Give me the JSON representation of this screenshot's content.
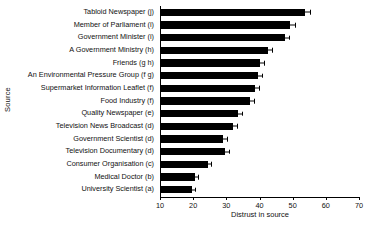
{
  "chart_data": {
    "type": "bar",
    "orientation": "horizontal",
    "title": "",
    "xlabel": "Distrust in source",
    "ylabel": "Source",
    "xlim": [
      10,
      70
    ],
    "xticks": [
      10,
      20,
      30,
      40,
      50,
      60,
      70
    ],
    "xticklabels": [
      "10",
      "20",
      "30",
      "40",
      "50",
      "60",
      "70"
    ],
    "grid": false,
    "legend": null,
    "categories": [
      "Tabloid Newspaper (j)",
      "Member of Parliament (i)",
      "Government Minister (i)",
      "A Government Ministry (h)",
      "Friends (g h)",
      "An Environmental Pressure Group (f g)",
      "Supermarket Information Leaflet (f)",
      "Food Industry (f)",
      "Quality Newspaper (e)",
      "Television News Broadcast (d)",
      "Government Scientist (d)",
      "Television Documentary (d)",
      "Consumer Organisation (c)",
      "Medical Doctor (b)",
      "University Scientist (a)"
    ],
    "values": [
      53.4,
      48.9,
      47.3,
      42.2,
      39.8,
      39.2,
      38.3,
      36.8,
      33.2,
      31.7,
      28.7,
      29.3,
      24.2,
      20.2,
      19.3
    ],
    "errors": [
      1.5,
      1.4,
      1.4,
      1.3,
      1.2,
      1.2,
      1.2,
      1.2,
      1.1,
      1.1,
      1.1,
      1.1,
      1.0,
      0.9,
      0.9
    ],
    "bar_color": "#000000"
  }
}
